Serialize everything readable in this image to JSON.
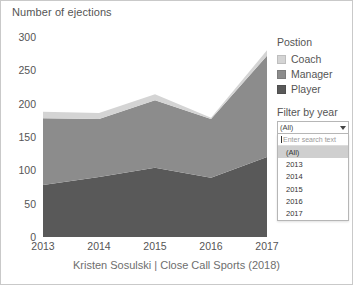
{
  "chart_data": {
    "type": "area",
    "title": "Number of ejections",
    "xlabel": "",
    "ylabel": "Number of ejections",
    "categories": [
      "2013",
      "2014",
      "2015",
      "2016",
      "2017"
    ],
    "x_tick_labels": [
      "2013",
      "2014",
      "2015",
      "2016",
      "2017"
    ],
    "y_tick_labels": [
      "0",
      "50",
      "100",
      "150",
      "200",
      "250",
      "300"
    ],
    "y_ticks": [
      0,
      50,
      100,
      150,
      200,
      250,
      300
    ],
    "ylim": [
      0,
      300
    ],
    "grid": false,
    "stacked": true,
    "legend_position": "right",
    "legend_title": "Postion",
    "series": [
      {
        "name": "Player",
        "color": "#595959",
        "values": [
          78,
          90,
          104,
          89,
          120
        ]
      },
      {
        "name": "Manager",
        "color": "#8c8c8c",
        "values": [
          100,
          87,
          101,
          88,
          152
        ]
      },
      {
        "name": "Coach",
        "color": "#d4d4d4",
        "values": [
          10,
          9,
          9,
          2,
          8
        ]
      }
    ],
    "totals": [
      188,
      186,
      214,
      179,
      280
    ],
    "caption": "Kristen Sosulski | Close Call Sports (2018)"
  },
  "legend": {
    "title": "Postion",
    "items": [
      {
        "label": "Coach",
        "color": "#d4d4d4"
      },
      {
        "label": "Manager",
        "color": "#8c8c8c"
      },
      {
        "label": "Player",
        "color": "#595959"
      }
    ]
  },
  "filter": {
    "title": "Filter by year",
    "selected": "(All)",
    "search_placeholder": "Enter search text",
    "options": [
      "(All)",
      "2013",
      "2014",
      "2015",
      "2016",
      "2017"
    ],
    "selected_index": 0
  },
  "caption": "Kristen Sosulski | Close Call Sports (2018)"
}
